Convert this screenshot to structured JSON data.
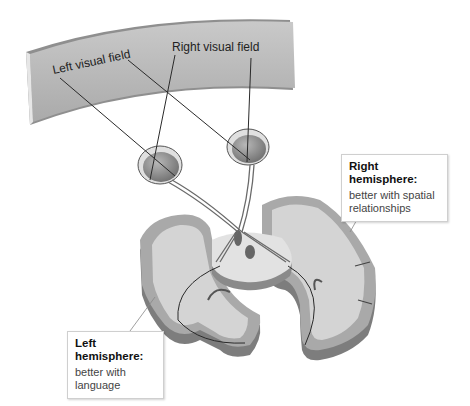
{
  "diagram": {
    "screen": {
      "left_field_label": "Left visual field",
      "right_field_label": "Right visual field"
    },
    "callouts": {
      "right_hemisphere": {
        "title": "Right hemisphere:",
        "line1": "better with spatial",
        "line2": "relationships"
      },
      "left_hemisphere": {
        "title": "Left hemisphere:",
        "line1": "better with",
        "line2": "language"
      }
    },
    "colors": {
      "screen_fill": "#b9b9b9",
      "brain_gray_matter": "#a9a9a9",
      "brain_white_matter": "#d4d4d4",
      "brain_side": "#7d7d7d",
      "eye_fill": "#9a9a9a",
      "line": "#2a2a2a"
    }
  }
}
